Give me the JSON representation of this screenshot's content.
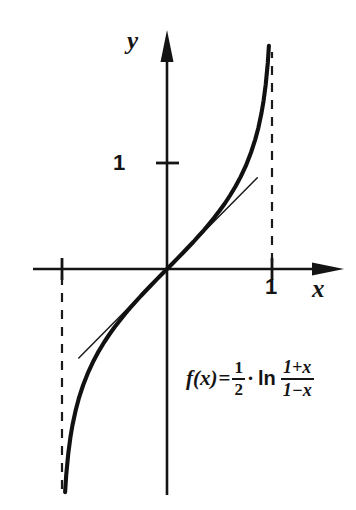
{
  "figure": {
    "title": "",
    "axes": {
      "x_label": "x",
      "y_label": "y",
      "x_tick_label": "1",
      "y_tick_label": "1",
      "x_tick_value": 1,
      "y_tick_value": 1,
      "origin_label": ""
    },
    "formula": {
      "function_name": "f",
      "variable": "x",
      "lhs": "f(x)",
      "equals": "=",
      "coefficient_numerator": "1",
      "coefficient_denominator": "2",
      "multiply": "·",
      "log_operator": "ln",
      "argument_numerator": "1+x",
      "argument_denominator": "1−x",
      "plain_text": "f(x) = 1/2 · ln (1+x)/(1−x)"
    },
    "colors": {
      "background": "#ffffff",
      "ink": "#141414",
      "curve": "#111111",
      "tangent": "#1a1a1a",
      "asymptote": "#1a1a1a"
    }
  },
  "chart_data": {
    "type": "line",
    "title": "",
    "subtitle": "",
    "xlabel": "x",
    "ylabel": "y",
    "xlim": [
      -1.27,
      1.5
    ],
    "ylim": [
      -2.22,
      2.22
    ],
    "grid": false,
    "legend_position": "none",
    "x_ticks": [
      1
    ],
    "x_tick_labels": [
      "1"
    ],
    "y_ticks": [
      1
    ],
    "y_tick_labels": [
      "1"
    ],
    "series": [
      {
        "name": "f(x) = 1/2 ln((1+x)/(1-x))",
        "style": "solid-thick",
        "x": [
          -0.9705,
          -0.96,
          -0.94,
          -0.92,
          -0.9,
          -0.87,
          -0.84,
          -0.8,
          -0.75,
          -0.7,
          -0.65,
          -0.6,
          -0.55,
          -0.5,
          -0.45,
          -0.4,
          -0.35,
          -0.3,
          -0.25,
          -0.2,
          -0.15,
          -0.1,
          -0.05,
          0,
          0.05,
          0.1,
          0.15,
          0.2,
          0.25,
          0.3,
          0.35,
          0.4,
          0.45,
          0.5,
          0.55,
          0.6,
          0.65,
          0.7,
          0.75,
          0.8,
          0.84,
          0.87,
          0.9,
          0.92,
          0.94,
          0.96,
          0.9705
        ],
        "y": [
          -2.105,
          -1.946,
          -1.738,
          -1.589,
          -1.472,
          -1.333,
          -1.221,
          -1.099,
          -0.973,
          -0.867,
          -0.775,
          -0.693,
          -0.618,
          -0.549,
          -0.485,
          -0.424,
          -0.365,
          -0.31,
          -0.255,
          -0.203,
          -0.151,
          -0.1,
          -0.05,
          0.0,
          0.05,
          0.1,
          0.151,
          0.203,
          0.255,
          0.31,
          0.365,
          0.424,
          0.485,
          0.549,
          0.618,
          0.693,
          0.775,
          0.867,
          0.973,
          1.099,
          1.221,
          1.333,
          1.472,
          1.589,
          1.738,
          1.946,
          2.105
        ]
      },
      {
        "name": "tangent at origin: y = x",
        "style": "solid-thin",
        "x": [
          -0.84,
          0.86
        ],
        "y": [
          -0.84,
          0.86
        ]
      }
    ],
    "asymptotes": [
      {
        "type": "vertical",
        "x": -1,
        "style": "dashed",
        "label": ""
      },
      {
        "type": "vertical",
        "x": 1,
        "style": "dashed",
        "label": ""
      }
    ],
    "annotations": [
      {
        "text": "f(x)=1/2 · ln (1+x)/(1−x)",
        "x": 0.28,
        "y": -0.95
      }
    ]
  }
}
